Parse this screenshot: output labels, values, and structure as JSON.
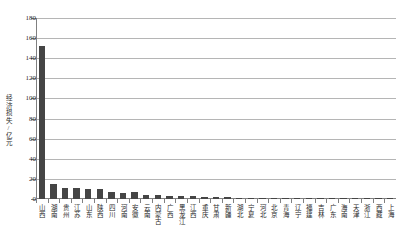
{
  "chart_data": {
    "type": "bar",
    "title": "",
    "xlabel": "",
    "ylabel": "经济损失/亿元",
    "ylim": [
      0,
      180
    ],
    "ytick_step": 20,
    "yticks": [
      180,
      160,
      140,
      120,
      100,
      80,
      60,
      40,
      20,
      0
    ],
    "grid": true,
    "legend": "none",
    "bar_color": "#454545",
    "categories": [
      "山西",
      "湖南",
      "贵州",
      "江苏",
      "山东",
      "陕西",
      "四川",
      "河南",
      "安徽",
      "云南",
      "内蒙古",
      "广西",
      "黑龙江",
      "江西",
      "重庆",
      "甘肃",
      "新疆",
      "湖北",
      "宁夏",
      "河北",
      "北京",
      "青海",
      "辽宁",
      "福建",
      "吉林",
      "广东",
      "海南",
      "天津",
      "浙江",
      "西藏",
      "上海"
    ],
    "values": [
      152,
      15,
      11,
      11,
      10,
      10,
      7,
      6,
      7,
      4,
      4,
      3,
      3,
      3,
      2.5,
      2,
      2,
      1.5,
      1.5,
      1.2,
      1,
      1,
      0.8,
      0.6,
      0.5,
      0.4,
      0.3,
      0.25,
      0.2,
      0.15,
      0.1
    ]
  }
}
